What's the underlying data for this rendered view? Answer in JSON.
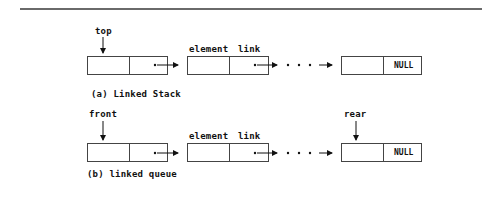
{
  "diagram": {
    "type": "linked-structures",
    "panels": [
      {
        "id": "a",
        "caption": "(a) Linked Stack",
        "pointer_label": "top",
        "field_labels": {
          "element": "element",
          "link": "link"
        },
        "nodes": [
          "first",
          "second",
          "last"
        ],
        "last_link": "NULL",
        "ellipsis": ". . ."
      },
      {
        "id": "b",
        "caption": "(b) linked queue",
        "pointer_label": "front",
        "rear_label": "rear",
        "field_labels": {
          "element": "element",
          "link": "link"
        },
        "nodes": [
          "first",
          "second",
          "last"
        ],
        "last_link": "NULL",
        "ellipsis": ". . ."
      }
    ]
  },
  "labels": {
    "stack_caption": "(a) Linked Stack",
    "queue_caption": "(b) linked queue",
    "top": "top",
    "front": "front",
    "rear": "rear",
    "element": "element",
    "link": "link",
    "null": "NULL"
  }
}
